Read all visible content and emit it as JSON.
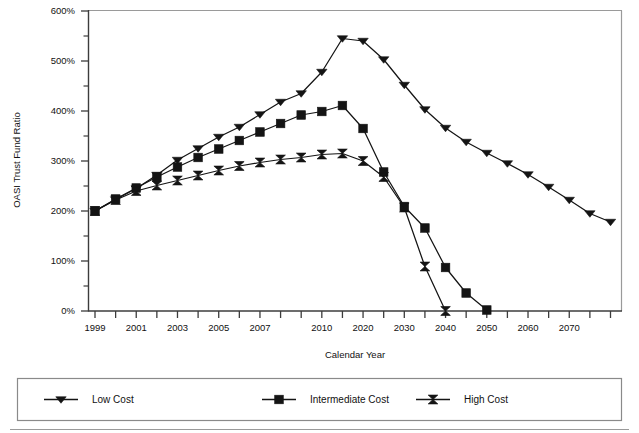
{
  "chart_data": {
    "type": "line",
    "title": "",
    "xlabel": "Calendar Year",
    "ylabel": "OASI Trust Fund Ratio",
    "ylim": [
      0,
      600
    ],
    "yticks": [
      0,
      100,
      200,
      300,
      400,
      500,
      600
    ],
    "ytick_labels": [
      "0%",
      "100%",
      "200%",
      "300%",
      "400%",
      "500%",
      "600%"
    ],
    "yminor_step": 50,
    "grid": false,
    "legend_position": "bottom",
    "x_categories": [
      "1999",
      "2000",
      "2001",
      "2002",
      "2003",
      "2004",
      "2005",
      "2006",
      "2007",
      "2008",
      "2009",
      "2010",
      "2015",
      "2020",
      "2025",
      "2030",
      "2035",
      "2040",
      "2045",
      "2050",
      "2055",
      "2060",
      "2065",
      "2070",
      "2075",
      "2080"
    ],
    "xtick_labels_shown": [
      "1999",
      "",
      "2001",
      "",
      "2003",
      "",
      "2005",
      "",
      "2007",
      "",
      "",
      "2010",
      "",
      "2020",
      "",
      "2030",
      "",
      "2040",
      "",
      "2050",
      "",
      "2060",
      "",
      "2070",
      "",
      ""
    ],
    "series": [
      {
        "name": "Low Cost",
        "marker": "triangle-down",
        "color": "#141414",
        "values": [
          200,
          223,
          245,
          272,
          302,
          325,
          348,
          368,
          393,
          418,
          435,
          478,
          545,
          540,
          503,
          452,
          403,
          366,
          338,
          316,
          295,
          273,
          248,
          222,
          195,
          178
        ]
      },
      {
        "name": "Intermediate Cost",
        "marker": "square",
        "color": "#141414",
        "values": [
          200,
          224,
          246,
          268,
          288,
          307,
          324,
          341,
          358,
          375,
          392,
          399,
          411,
          365,
          278,
          209,
          166,
          87,
          36,
          2,
          null,
          null,
          null,
          null,
          null,
          null
        ]
      },
      {
        "name": "High Cost",
        "marker": "hourglass",
        "color": "#141414",
        "values": [
          200,
          222,
          240,
          251,
          261,
          271,
          281,
          290,
          297,
          303,
          307,
          313,
          315,
          300,
          268,
          207,
          89,
          0,
          null,
          null,
          null,
          null,
          null,
          null,
          null,
          null
        ]
      }
    ]
  },
  "legend": {
    "items": [
      {
        "label": "Low Cost",
        "marker": "triangle-down"
      },
      {
        "label": "Intermediate Cost",
        "marker": "square"
      },
      {
        "label": "High Cost",
        "marker": "hourglass"
      }
    ]
  },
  "axes": {
    "y_title": "OASI Trust Fund Ratio",
    "x_title": "Calendar Year"
  },
  "colors": {
    "ink": "#141414",
    "frame": "#8a8a8a",
    "axis": "#3c3c3c",
    "background": "#ffffff"
  }
}
